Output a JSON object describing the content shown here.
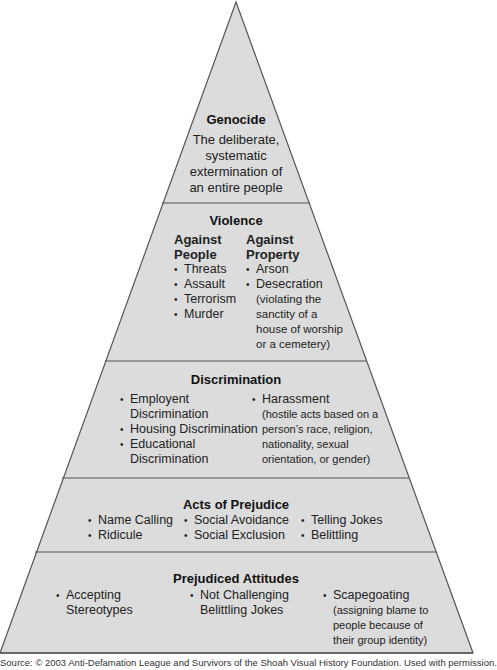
{
  "pyramid": {
    "colors": {
      "fill": "#dcdcdc",
      "stroke": "#555555",
      "text": "#1e1e1e"
    },
    "layers": {
      "genocide": {
        "title": "Genocide",
        "description_lines": [
          "The deliberate,",
          "systematic",
          "extermination of",
          "an entire people"
        ]
      },
      "violence": {
        "title": "Violence",
        "against_people": {
          "heading_lines": [
            "Against",
            "People"
          ],
          "items": [
            "Threats",
            "Assault",
            "Terrorism",
            "Murder"
          ]
        },
        "against_property": {
          "heading_lines": [
            "Against",
            "Property"
          ],
          "items": [
            "Arson",
            "Desecration"
          ],
          "note_lines": [
            "(violating the",
            "sanctity of a",
            "house of worship",
            "or a cemetery)"
          ]
        }
      },
      "discrimination": {
        "title": "Discrimination",
        "left_items": [
          {
            "line1": "Employent",
            "line2": "Discrimination"
          },
          {
            "line1": "Housing Discrimination",
            "line2": ""
          },
          {
            "line1": "Educational",
            "line2": "Discrimination"
          }
        ],
        "right_item": "Harassment",
        "right_note_lines": [
          "(hostile acts based on a",
          "person’s race, religion,",
          "nationality, sexual",
          "orientation, or gender)"
        ]
      },
      "acts_of_prejudice": {
        "title": "Acts of Prejudice",
        "col1": [
          "Name Calling",
          "Ridicule"
        ],
        "col2": [
          "Social Avoidance",
          "Social Exclusion"
        ],
        "col3": [
          "Telling Jokes",
          "Belittling"
        ]
      },
      "prejudiced_attitudes": {
        "title": "Prejudiced Attitudes",
        "col1": {
          "line1": "Accepting",
          "line2": "Stereotypes"
        },
        "col2": {
          "line1": "Not Challenging",
          "line2": "Belittling Jokes"
        },
        "col3": {
          "line1": "Scapegoating",
          "note_lines": [
            "(assigning blame to",
            "people because of",
            "their group identity)"
          ]
        }
      }
    }
  },
  "source": "Source: © 2003 Anti-Defamation League and Survivors of the Shoah Visual History Foundation. Used with permission."
}
